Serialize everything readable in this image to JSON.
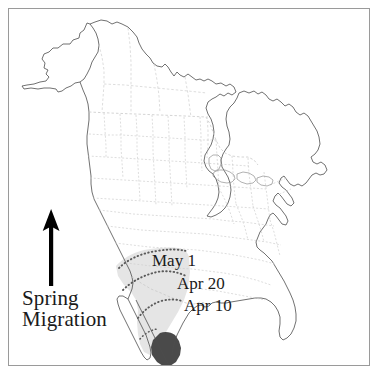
{
  "figure": {
    "type": "map",
    "region": "North America",
    "background_color": "#ffffff",
    "frame_color": "#9a9a9a"
  },
  "legend": {
    "title_line1": "Spring",
    "title_line2": "Migration",
    "arrow_direction": "north",
    "arrow_color": "#000000"
  },
  "isochrones": [
    {
      "label": "May 1",
      "date": "May 1"
    },
    {
      "label": "Apr 20",
      "date": "Apr 20"
    },
    {
      "label": "Apr 10",
      "date": "Apr 10"
    }
  ],
  "ranges": {
    "wintering_label": "wintering range",
    "wintering_color": "#4a4a4a",
    "corridor_label": "migration corridor",
    "corridor_color": "#e0e0e0"
  },
  "colors": {
    "coastline": "#4d4d4d",
    "internal_border": "#c9c9c9",
    "isochrone_line": "#6d6d6d",
    "text": "#1a1a1a"
  }
}
